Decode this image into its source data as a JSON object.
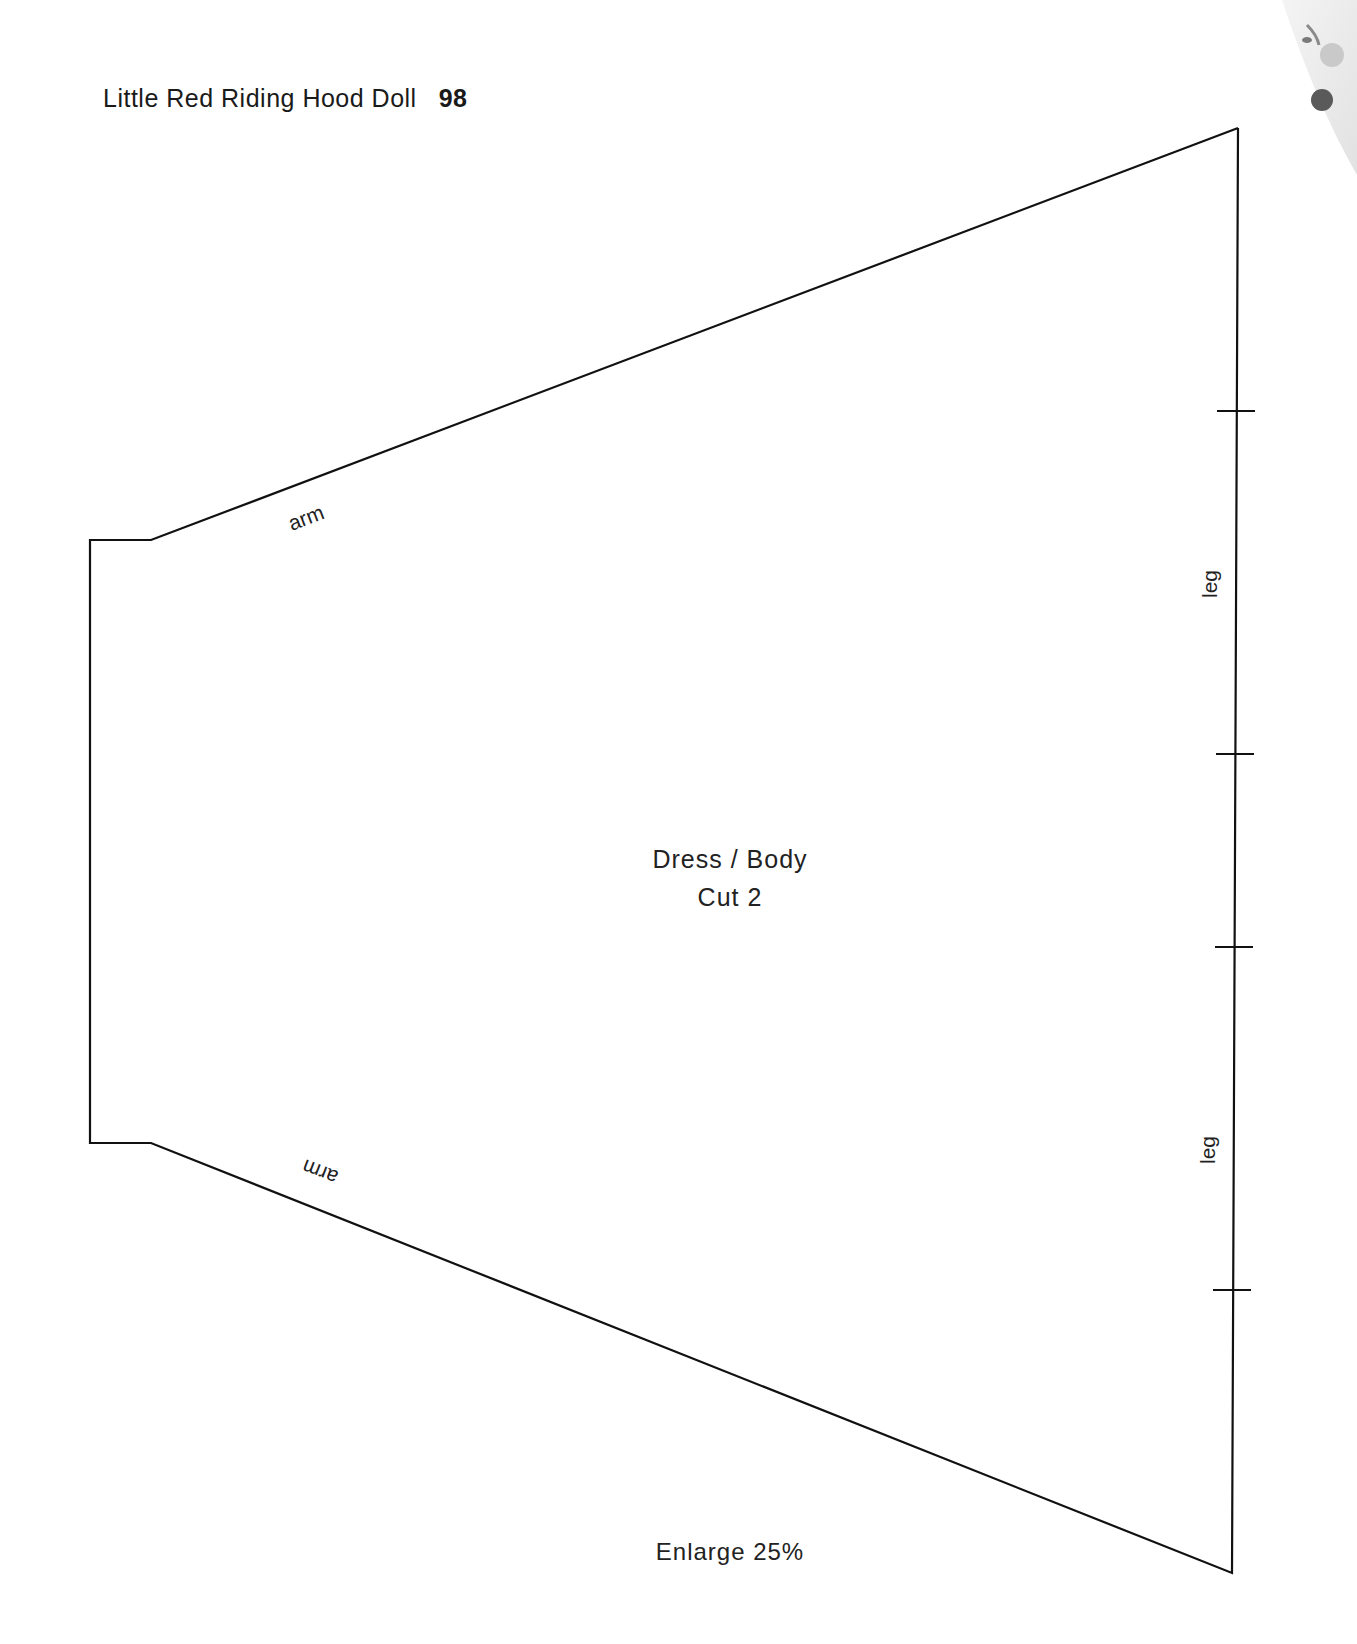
{
  "header": {
    "title": "Little Red Riding Hood Doll",
    "page_number": "98"
  },
  "pattern": {
    "piece_name": "Dress / Body",
    "cut_instruction": "Cut 2",
    "edge_labels": {
      "arm_top": "arm",
      "arm_bottom": "arm",
      "leg_upper": "leg",
      "leg_lower": "leg"
    },
    "notch_marks": 4
  },
  "footer": {
    "instruction": "Enlarge 25%"
  },
  "decoration": {
    "corner_image": "floral-fabric-corner"
  }
}
